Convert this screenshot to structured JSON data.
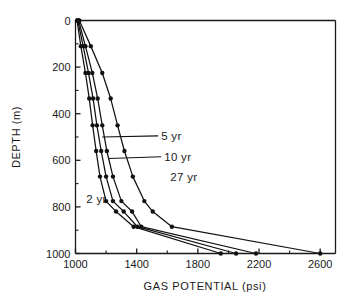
{
  "chart_data": {
    "type": "line",
    "title": "",
    "xlabel": "GAS  POTENTIAL   (psi)",
    "ylabel": "DEPTH  (m)",
    "xlim": [
      1000,
      2700
    ],
    "ylim": [
      0,
      1000
    ],
    "y_inverted": true,
    "grid": false,
    "legend_position": "inline-annotations",
    "x_ticks": [
      1000,
      1400,
      1800,
      2200,
      2600
    ],
    "x_tick_labels": [
      "1000",
      "1400",
      "1800",
      "2200",
      "2600"
    ],
    "x_minor_ticks": [
      1200,
      1600,
      2000,
      2400
    ],
    "y_ticks": [
      0,
      200,
      400,
      600,
      800,
      1000
    ],
    "y_tick_labels": [
      "0",
      "200",
      "400",
      "600",
      "800",
      "1000"
    ],
    "y_minor_ticks": [
      100,
      300,
      500,
      700,
      900
    ],
    "series": [
      {
        "name": "2 yr",
        "label": "2 yr",
        "x": [
          1010,
          1035,
          1065,
          1090,
          1112,
          1135,
          1160,
          1200,
          1265,
          1380,
          1950
        ],
        "y": [
          0,
          110,
          225,
          335,
          450,
          560,
          670,
          775,
          820,
          885,
          1000
        ]
      },
      {
        "name": "5 yr",
        "label": "5 yr",
        "x": [
          1015,
          1050,
          1085,
          1115,
          1140,
          1168,
          1200,
          1245,
          1315,
          1405,
          2050
        ],
        "y": [
          0,
          110,
          225,
          335,
          450,
          560,
          670,
          775,
          820,
          885,
          1000
        ]
      },
      {
        "name": "10 yr",
        "label": "10 yr",
        "x": [
          1020,
          1065,
          1110,
          1145,
          1175,
          1205,
          1245,
          1300,
          1370,
          1430,
          2180
        ],
        "y": [
          0,
          110,
          225,
          335,
          450,
          560,
          670,
          775,
          820,
          885,
          1000
        ]
      },
      {
        "name": "27 yr",
        "label": "27 yr",
        "x": [
          1025,
          1100,
          1175,
          1230,
          1275,
          1320,
          1375,
          1450,
          1505,
          1630,
          2600
        ],
        "y": [
          0,
          110,
          225,
          335,
          450,
          560,
          670,
          775,
          820,
          885,
          1000
        ]
      }
    ],
    "annotations": [
      {
        "text": "5 yr",
        "x": 1560,
        "y": 495,
        "leader_to_x": 1175,
        "leader_to_y": 500
      },
      {
        "text": "10 yr",
        "x": 1580,
        "y": 585,
        "leader_to_x": 1215,
        "leader_to_y": 592
      },
      {
        "text": "27 yr",
        "x": 1620,
        "y": 672,
        "leader_to_x": null,
        "leader_to_y": null
      },
      {
        "text": "2 yr",
        "x": 1070,
        "y": 765,
        "leader_to_x": null,
        "leader_to_y": null
      }
    ]
  }
}
